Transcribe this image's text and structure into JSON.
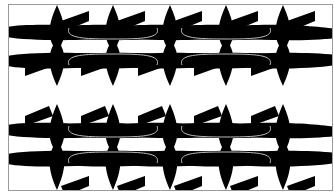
{
  "image": {
    "description": "Tessellation of black airplane-like silhouettes in two rows",
    "background_color": "#ffffff",
    "frame_color": "#9a9a9a",
    "fill_color": "#000000",
    "outline_color": "#bdbdbd"
  },
  "frame": {
    "x": 8,
    "y": 4,
    "width": 324,
    "height": 186
  },
  "rows": [
    {
      "name": "top-row",
      "spindle_top": 5,
      "spindle_bottom": 86,
      "upper_wing_y": 33,
      "lower_wing_y": 60,
      "flip": false
    },
    {
      "name": "bottom-row",
      "spindle_top": 104,
      "spindle_bottom": 190,
      "upper_wing_y": 131,
      "lower_wing_y": 158,
      "flip": true
    }
  ],
  "spindle_centers_x": [
    57,
    113,
    170,
    226,
    283
  ]
}
